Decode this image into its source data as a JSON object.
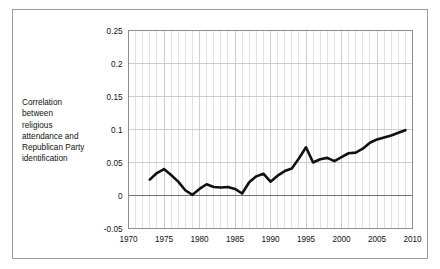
{
  "figure": {
    "top_cut_text": "",
    "border_color": "#9b9b9b",
    "background_color": "#ffffff"
  },
  "y_axis_caption": {
    "lines": [
      "Correlation",
      "between",
      "religious",
      "attendance and",
      "Republican Party",
      "identification"
    ]
  },
  "chart_data": {
    "type": "line",
    "title": "",
    "subtitle": "",
    "xlabel": "",
    "ylabel": "Correlation between religious attendance and Republican Party identification",
    "xlim": [
      1970,
      2010
    ],
    "ylim": [
      -0.05,
      0.25
    ],
    "yticks": [
      -0.05,
      0,
      0.05,
      0.1,
      0.15,
      0.2,
      0.25
    ],
    "ytick_labels": [
      "-0.05",
      "0",
      "0.05",
      "0.1",
      "0.15",
      "0.2",
      "0.25"
    ],
    "xticks": [
      1970,
      1975,
      1980,
      1985,
      1990,
      1995,
      2000,
      2005,
      2010
    ],
    "xtick_labels": [
      "1970",
      "1975",
      "1980",
      "1985",
      "1990",
      "1995",
      "2000",
      "2005",
      "2010"
    ],
    "grid": true,
    "grid_minor_x_step": 1,
    "grid_major_y_step": 0.05,
    "grid_color": "#c6c6d2",
    "zero_line": true,
    "zero_line_color": "#6f6f78",
    "legend": "none",
    "line_color": "#111111",
    "line_width": 2.6,
    "series": [
      {
        "name": "Correlation between religious attendance and Republican Party identification",
        "x": [
          1973,
          1974,
          1975,
          1976,
          1977,
          1978,
          1979,
          1980,
          1981,
          1982,
          1983,
          1984,
          1985,
          1986,
          1987,
          1988,
          1989,
          1990,
          1991,
          1992,
          1993,
          1994,
          1995,
          1996,
          1997,
          1998,
          1999,
          2000,
          2001,
          2002,
          2003,
          2004,
          2005,
          2006,
          2007,
          2008,
          2009
        ],
        "y": [
          0.024,
          0.034,
          0.04,
          0.031,
          0.021,
          0.008,
          0.001,
          0.01,
          0.017,
          0.013,
          0.012,
          0.013,
          0.01,
          0.003,
          0.02,
          0.029,
          0.033,
          0.021,
          0.03,
          0.037,
          0.041,
          0.056,
          0.073,
          0.05,
          0.055,
          0.057,
          0.052,
          0.058,
          0.064,
          0.065,
          0.071,
          0.08,
          0.085,
          0.088,
          0.091,
          0.095,
          0.099
        ]
      }
    ]
  }
}
